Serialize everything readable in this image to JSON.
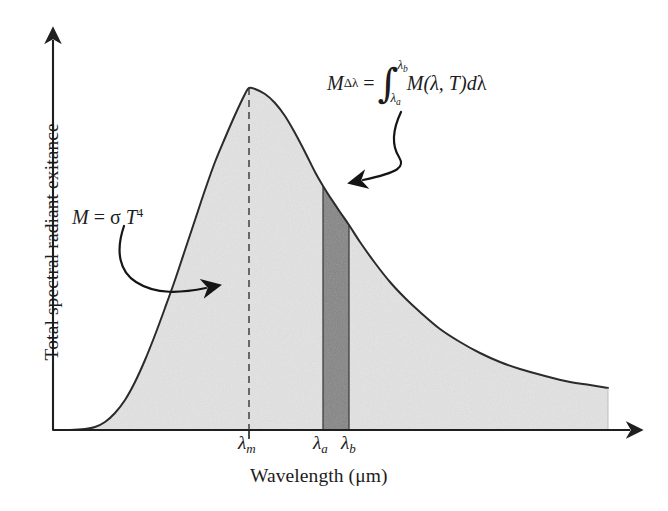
{
  "figure": {
    "name": "blackbody-spectral-radiant-exitance-diagram",
    "axes": {
      "y_label": "Total spectral radiant exitance",
      "x_label": "Wavelength (μm)"
    },
    "tick_labels": {
      "lambda_m": {
        "symbol": "λ",
        "sub": "m"
      },
      "lambda_a": {
        "symbol": "λ",
        "sub": "a"
      },
      "lambda_b": {
        "symbol": "λ",
        "sub": "b"
      }
    },
    "annotations": {
      "stefan_boltzmann": {
        "m": "M",
        "equals": "=",
        "sigma": "σ",
        "t": "T",
        "exponent": "4",
        "plain": "M = σ T⁴"
      },
      "band_integral": {
        "lhs_symbol": "M",
        "lhs_sub": "Δλ",
        "equals": "=",
        "upper_limit": "λ",
        "upper_limit_sub": "b",
        "lower_limit": "λ",
        "lower_limit_sub": "a",
        "integrand": "M(λ, T)",
        "differential_d": "d",
        "differential_var": "λ",
        "plain": "MΔλ = ∫(λa..λb) M(λ, T) dλ"
      }
    },
    "colors": {
      "curve_stroke": "#2b2b2b",
      "total_area_fill": "#e3e3e3",
      "band_area_fill": "#858585",
      "axis": "#1f1f1f",
      "background": "#ffffff"
    }
  },
  "chart_data": {
    "type": "area",
    "title": "",
    "xlabel": "Wavelength (μm)",
    "ylabel": "Total spectral radiant exitance",
    "grid": false,
    "legend": null,
    "axis_ticks_numeric": false,
    "named_x_ticks": [
      {
        "label": "λ_m",
        "meaning": "peak wavelength",
        "x_px": 249
      },
      {
        "label": "λ_a",
        "meaning": "band lower limit",
        "x_px": 323
      },
      {
        "label": "λ_b",
        "meaning": "band upper limit",
        "x_px": 349
      }
    ],
    "series": [
      {
        "name": "Spectral radiant exitance M(λ, T)",
        "fill": "#e3e3e3",
        "x": [
          53,
          70,
          85,
          95,
          105,
          115,
          125,
          135,
          145,
          155,
          165,
          175,
          185,
          195,
          205,
          215,
          225,
          235,
          245,
          249,
          255,
          265,
          275,
          285,
          295,
          305,
          315,
          323,
          330,
          340,
          349,
          360,
          375,
          390,
          405,
          420,
          440,
          460,
          480,
          500,
          520,
          545,
          570,
          590,
          608
        ],
        "y": [
          0,
          0,
          1,
          3,
          8,
          17,
          30,
          48,
          70,
          95,
          122,
          150,
          180,
          210,
          240,
          268,
          292,
          315,
          336,
          342,
          341,
          336,
          327,
          314,
          297,
          278,
          258,
          244,
          233,
          218,
          205,
          188,
          167,
          148,
          132,
          118,
          101,
          88,
          77,
          68,
          61,
          54,
          48,
          45,
          42
        ],
        "y_note": "pixel height above baseline y=430"
      },
      {
        "name": "Band Δλ (λ_a to λ_b)",
        "fill": "#858585",
        "x_range": [
          323,
          349
        ],
        "is_shaded_band": true
      }
    ],
    "annotations": [
      {
        "text": "M = σ T⁴",
        "points_to": "total shaded area",
        "arrow": "curved-right"
      },
      {
        "text": "MΔλ = ∫ M(λ, T) dλ",
        "points_to": "dark band Δλ",
        "arrow": "curved-down-left"
      }
    ]
  }
}
